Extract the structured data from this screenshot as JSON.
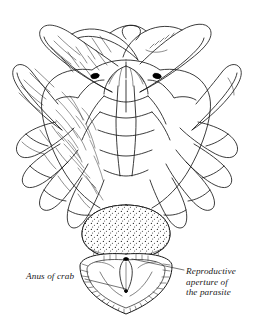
{
  "figure": {
    "subject": "crab",
    "view": "ventral",
    "style": "line engraving with stipple and hatching",
    "colors": {
      "ink": "#1a1a1a",
      "background": "#ffffff",
      "eye_fill": "#000000"
    }
  },
  "labels": {
    "anus": {
      "text": "Anus of crab",
      "leader": "horizontal-line-to-right"
    },
    "reproductive_aperture": {
      "line1": "Reproductive",
      "line2": "aperture of",
      "line3": "the parasite",
      "leader": "diagonal-line-up-left"
    }
  },
  "anatomy": {
    "chelipeds": [
      "left-cheliped",
      "right-cheliped"
    ],
    "eyes": [
      "left-eye",
      "right-eye"
    ],
    "walking_legs_left": 4,
    "walking_legs_right": 4,
    "parasite_externa": "stippled-sac",
    "crab_abdomen": "hatched-shield-flap",
    "telson": "central-spike"
  }
}
